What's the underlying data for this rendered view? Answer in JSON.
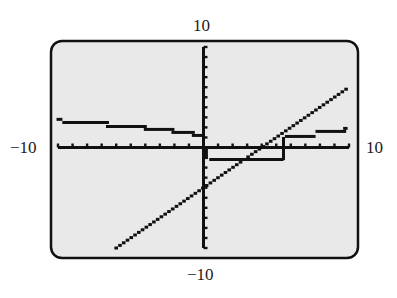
{
  "chart_data": {
    "type": "line",
    "title": "",
    "xlabel": "",
    "ylabel": "",
    "window": {
      "xmin": -10,
      "xmax": 10,
      "ymin": -10,
      "ymax": 10,
      "xscl": 1,
      "yscl": 1
    },
    "tick_labels": {
      "ymax": "10",
      "ymin": "−10",
      "xmin": "−10",
      "xmax": "10"
    },
    "grid": false,
    "legend": null,
    "series": [
      {
        "name": "linear",
        "style": "dotted",
        "points": [
          [
            -6.0,
            -10.0
          ],
          [
            9.8,
            5.8
          ]
        ]
      },
      {
        "name": "step-curve-left",
        "style": "steps",
        "segments": [
          [
            [
              -10.0,
              2.8
            ],
            [
              -9.8,
              2.8
            ]
          ],
          [
            [
              -9.6,
              2.5
            ],
            [
              -6.6,
              2.5
            ]
          ],
          [
            [
              -6.6,
              2.1
            ],
            [
              -4.0,
              2.1
            ]
          ],
          [
            [
              -4.0,
              1.8
            ],
            [
              -2.1,
              1.8
            ]
          ],
          [
            [
              -2.1,
              1.5
            ],
            [
              -0.7,
              1.5
            ]
          ],
          [
            [
              -0.7,
              1.2
            ],
            [
              -0.1,
              1.2
            ]
          ]
        ]
      },
      {
        "name": "step-curve-right",
        "style": "steps",
        "segments": [
          [
            [
              0.2,
              0.0
            ],
            [
              0.2,
              -1.0
            ]
          ],
          [
            [
              0.5,
              -1.2
            ],
            [
              5.4,
              -1.2
            ]
          ],
          [
            [
              5.5,
              -1.1
            ],
            [
              5.5,
              0.9
            ]
          ],
          [
            [
              5.7,
              1.1
            ],
            [
              7.6,
              1.1
            ]
          ],
          [
            [
              7.8,
              1.6
            ],
            [
              9.7,
              1.6
            ]
          ],
          [
            [
              9.7,
              1.9
            ],
            [
              9.8,
              1.9
            ]
          ]
        ]
      }
    ]
  },
  "screen": {
    "background": "#e9e9e9",
    "border_color": "#111111",
    "ink_color": "#111111"
  },
  "labels": {
    "top": "10",
    "bottom": "−10",
    "left": "−10",
    "right": "10"
  }
}
